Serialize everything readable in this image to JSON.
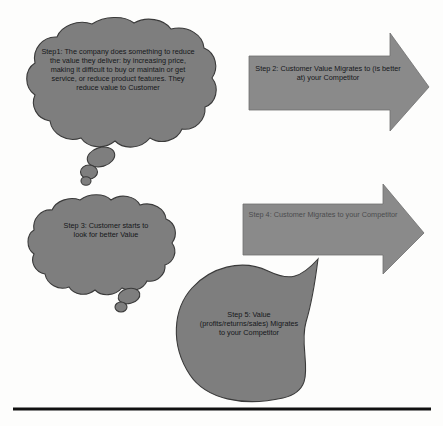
{
  "diagram": {
    "background_color": "#fdfdfc",
    "shape_fill": "#7e7e7e",
    "shape_stroke": "#3c3c3c",
    "arrow_fill": "#878787",
    "rule_color": "#111111",
    "steps": [
      {
        "id": "step1",
        "shape": "thought-cloud",
        "text": "Step1: The company does something to reduce the value they deliver: by increasing price, making it difficult to buy or maintain or get service, or reduce product features. They reduce value to Customer",
        "text_color": "#15171a"
      },
      {
        "id": "step2",
        "shape": "right-arrow",
        "text": "Step 2: Customer Value Migrates to (is better at) your Competitor",
        "text_color": "#15171a"
      },
      {
        "id": "step3",
        "shape": "thought-cloud",
        "text": "Step 3: Customer starts to look for better Value",
        "text_color": "#15171a"
      },
      {
        "id": "step4",
        "shape": "right-arrow",
        "text": "Step 4: Customer Migrates to your Competitor",
        "text_color": "#4a4c4e"
      },
      {
        "id": "step5",
        "shape": "teardrop",
        "text": "Step 5: Value (profits/returns/sales) Migrates to your Competitor",
        "text_color": "#15171a"
      }
    ],
    "divider": {
      "name": "horizontal-rule",
      "x1": 13,
      "x2": 431,
      "y": 409
    }
  }
}
